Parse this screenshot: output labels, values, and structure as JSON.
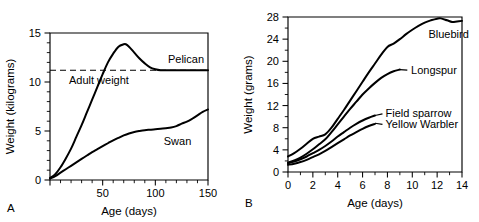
{
  "figure": {
    "background_color": "#ffffff",
    "ink_color": "#000000"
  },
  "panels": [
    {
      "letter": "A",
      "xlabel": "Age (days)",
      "ylabel": "Weight (kilograms)"
    },
    {
      "letter": "B",
      "xlabel": "Age (days)",
      "ylabel": "Weight (grams)"
    }
  ],
  "chart_data": [
    {
      "type": "line",
      "panel": "A",
      "title": "",
      "xlabel": "Age (days)",
      "ylabel": "Weight (kilograms)",
      "xlim": [
        0,
        150
      ],
      "ylim": [
        0,
        15
      ],
      "xticks": [
        0,
        50,
        100,
        150
      ],
      "xticklabels": [
        "",
        "50",
        "100",
        "150"
      ],
      "xticks_minor_step": 10,
      "yticks": [
        0,
        5,
        10,
        15
      ],
      "yticklabels": [
        "0",
        "5",
        "10",
        "15"
      ],
      "yticks_minor_step": 1,
      "grid": false,
      "legend_position": "inline-curve-labels",
      "annotations": [
        {
          "text": "Adult weight",
          "x": 18,
          "y": 10.2,
          "note": "label for dashed reference line"
        }
      ],
      "reference_lines": [
        {
          "name": "adult-weight",
          "orientation": "horizontal",
          "value": 11.2,
          "style": "dashed",
          "x_start": 0,
          "x_end": 150
        }
      ],
      "series": [
        {
          "name": "Pelican",
          "label_x": 112,
          "label_y": 12.3,
          "x": [
            0,
            5,
            10,
            15,
            20,
            25,
            30,
            35,
            40,
            45,
            50,
            55,
            60,
            65,
            70,
            72,
            75,
            80,
            85,
            90,
            95,
            100,
            105,
            110,
            120,
            130,
            140,
            150
          ],
          "y": [
            0.2,
            0.6,
            1.3,
            2.2,
            3.2,
            4.4,
            5.6,
            6.9,
            8.2,
            9.5,
            10.8,
            12.0,
            12.9,
            13.6,
            13.85,
            13.85,
            13.6,
            13.0,
            12.4,
            11.9,
            11.5,
            11.3,
            11.2,
            11.2,
            11.2,
            11.2,
            11.2,
            11.2
          ]
        },
        {
          "name": "Swan",
          "label_x": 108,
          "label_y": 4.0,
          "x": [
            0,
            5,
            10,
            15,
            20,
            25,
            30,
            35,
            40,
            45,
            50,
            55,
            60,
            65,
            70,
            75,
            80,
            85,
            90,
            95,
            100,
            105,
            110,
            115,
            120,
            125,
            130,
            135,
            140,
            145,
            150
          ],
          "y": [
            0.15,
            0.4,
            0.75,
            1.1,
            1.45,
            1.8,
            2.15,
            2.5,
            2.85,
            3.15,
            3.45,
            3.75,
            4.05,
            4.3,
            4.55,
            4.75,
            4.9,
            5.0,
            5.08,
            5.13,
            5.18,
            5.22,
            5.28,
            5.35,
            5.5,
            5.75,
            5.95,
            6.25,
            6.6,
            6.95,
            7.2
          ]
        }
      ]
    },
    {
      "type": "line",
      "panel": "B",
      "title": "",
      "xlabel": "Age (days)",
      "ylabel": "Weight (grams)",
      "xlim": [
        0,
        14
      ],
      "ylim": [
        0,
        28
      ],
      "xticks": [
        0,
        2,
        4,
        6,
        8,
        10,
        12,
        14
      ],
      "xticklabels": [
        "0",
        "2",
        "4",
        "6",
        "8",
        "10",
        "12",
        "14"
      ],
      "xticks_minor_step": 1,
      "yticks": [
        0,
        4,
        8,
        12,
        16,
        20,
        24,
        28
      ],
      "yticklabels": [
        "0",
        "4",
        "8",
        "12",
        "16",
        "20",
        "24",
        "28"
      ],
      "yticks_minor_step": 2,
      "grid": false,
      "legend_position": "inline-curve-labels",
      "series": [
        {
          "name": "Bluebird",
          "label_x": 11.3,
          "label_y": 25.0,
          "leader": false,
          "x": [
            0,
            0.5,
            1,
            1.5,
            2,
            2.5,
            3,
            3.5,
            4,
            4.5,
            5,
            5.5,
            6,
            6.5,
            7,
            7.5,
            8,
            8.5,
            9,
            9.5,
            10,
            10.5,
            11,
            11.5,
            12,
            12.3,
            12.8,
            13.2,
            13.6,
            14
          ],
          "y": [
            2.8,
            3.4,
            4.2,
            5.1,
            6.0,
            6.4,
            6.8,
            8.0,
            9.6,
            11.2,
            12.9,
            14.6,
            16.3,
            18.0,
            19.6,
            21.2,
            22.6,
            23.2,
            24.0,
            24.9,
            25.7,
            26.4,
            27.0,
            27.4,
            27.7,
            27.75,
            27.4,
            27.1,
            27.2,
            27.3
          ]
        },
        {
          "name": "Longspur",
          "label_x": 9.9,
          "label_y": 18.4,
          "leader": true,
          "leader_x1": 9.0,
          "leader_y1": 18.5,
          "leader_x2": 9.6,
          "leader_y2": 18.4,
          "x": [
            0,
            0.5,
            1,
            1.5,
            2,
            2.5,
            3,
            3.5,
            4,
            4.5,
            5,
            5.5,
            6,
            6.5,
            7,
            7.5,
            8,
            8.5,
            9
          ],
          "y": [
            1.7,
            2.1,
            2.6,
            3.3,
            4.1,
            5.0,
            5.9,
            7.2,
            8.6,
            10.0,
            11.4,
            12.7,
            14.0,
            15.1,
            16.1,
            17.0,
            17.7,
            18.2,
            18.5
          ]
        },
        {
          "name": "Field sparrow",
          "label_x": 7.85,
          "label_y": 10.6,
          "leader": true,
          "leader_x1": 7.0,
          "leader_y1": 10.2,
          "leader_x2": 7.6,
          "leader_y2": 10.5,
          "x": [
            0,
            0.5,
            1,
            1.5,
            2,
            2.5,
            3,
            3.5,
            4,
            4.5,
            5,
            5.5,
            6,
            6.5,
            7
          ],
          "y": [
            1.6,
            1.9,
            2.3,
            2.8,
            3.4,
            4.0,
            4.7,
            5.5,
            6.4,
            7.2,
            8.0,
            8.7,
            9.3,
            9.8,
            10.2
          ]
        },
        {
          "name": "Yellow Warbler",
          "label_x": 7.85,
          "label_y": 8.6,
          "leader": true,
          "leader_x1": 7.0,
          "leader_y1": 8.8,
          "leader_x2": 7.6,
          "leader_y2": 8.6,
          "x": [
            0,
            0.5,
            1,
            1.5,
            2,
            2.5,
            3,
            3.5,
            4,
            4.5,
            5,
            5.5,
            6,
            6.5,
            7
          ],
          "y": [
            1.3,
            1.5,
            1.8,
            2.2,
            2.7,
            3.2,
            3.8,
            4.5,
            5.2,
            5.9,
            6.6,
            7.2,
            7.8,
            8.3,
            8.7
          ]
        }
      ]
    }
  ]
}
